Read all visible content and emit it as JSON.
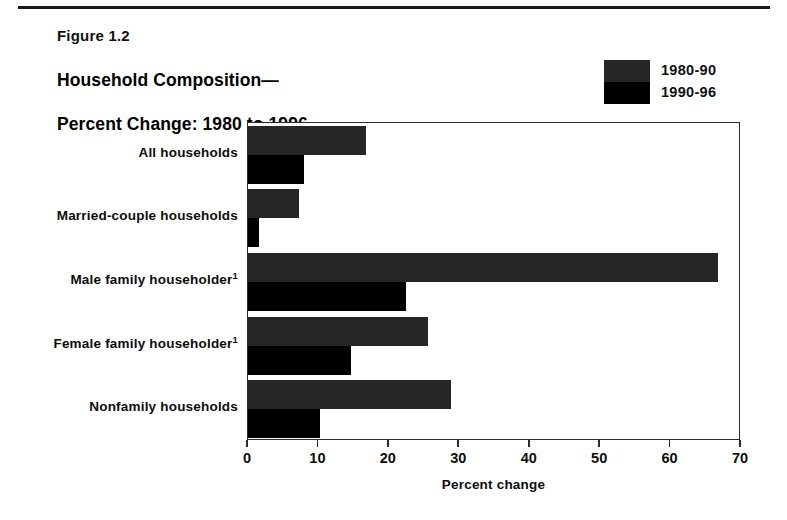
{
  "figure": {
    "number": "Figure 1.2",
    "title": "Household Composition—\nPercent Change:  1980 to 1996",
    "title_line1": "Household Composition—",
    "title_line2": "Percent Change:  1980 to 1996"
  },
  "legend": {
    "position": "top-right",
    "entries": [
      {
        "label": "1980-90",
        "color": "#262626"
      },
      {
        "label": "1990-96",
        "color": "#000000"
      }
    ]
  },
  "axis": {
    "x_title": "Percent change",
    "ticks": [
      "0",
      "10",
      "20",
      "30",
      "40",
      "50",
      "60",
      "70"
    ]
  },
  "chart_data": {
    "type": "bar",
    "orientation": "horizontal",
    "subtitle": "Figure 1.2",
    "xlabel": "Percent change",
    "ylabel": "",
    "xlim": [
      0,
      70
    ],
    "xticks": [
      0,
      10,
      20,
      30,
      40,
      50,
      60,
      70
    ],
    "grid": false,
    "legend_position": "top-right",
    "categories": [
      "All households",
      "Married-couple households",
      "Male family householder",
      "Female family householder",
      "Nonfamily households"
    ],
    "category_footnotes": [
      "",
      "",
      "1",
      "1",
      ""
    ],
    "series": [
      {
        "name": "1980-90",
        "color": "#262626",
        "values": [
          16.8,
          7.2,
          66.8,
          25.6,
          28.8
        ]
      },
      {
        "name": "1990-96",
        "color": "#000000",
        "values": [
          8.0,
          1.6,
          22.4,
          14.6,
          10.2
        ]
      }
    ]
  }
}
